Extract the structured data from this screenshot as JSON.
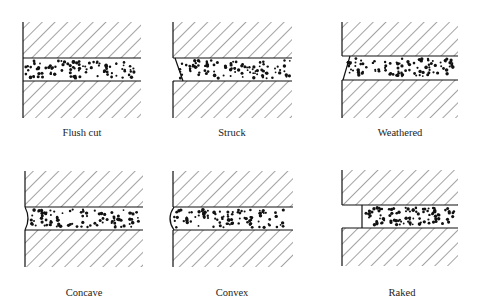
{
  "figure": {
    "colors": {
      "line": "#111111",
      "hatch": "#333333",
      "dots": "#111111",
      "background": "#ffffff"
    },
    "panels": [
      {
        "id": "flush-cut",
        "label": "Flush cut"
      },
      {
        "id": "struck",
        "label": "Struck"
      },
      {
        "id": "weathered",
        "label": "Weathered"
      },
      {
        "id": "concave",
        "label": "Concave"
      },
      {
        "id": "convex",
        "label": "Convex"
      },
      {
        "id": "raked",
        "label": "Raked"
      }
    ]
  }
}
